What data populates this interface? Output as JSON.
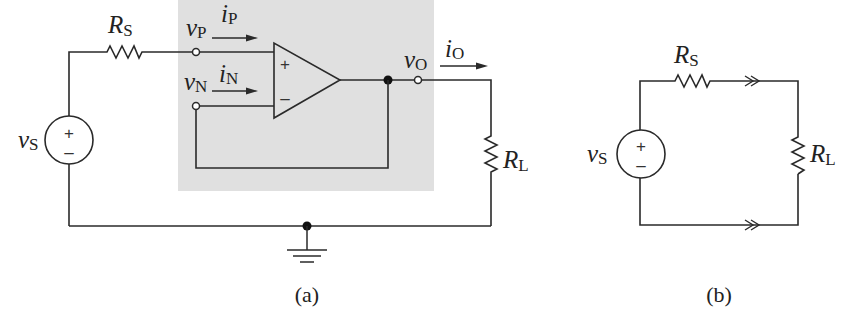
{
  "figure": {
    "a": {
      "caption": "(a)",
      "source": {
        "symbol": "v",
        "subscript": "S",
        "plus": "+",
        "minus": "–"
      },
      "source_resistor": {
        "symbol": "R",
        "subscript": "S"
      },
      "load_resistor": {
        "symbol": "R",
        "subscript": "L"
      },
      "noninverting_input": {
        "voltage_symbol": "v",
        "voltage_subscript": "P",
        "current_symbol": "i",
        "current_subscript": "P"
      },
      "inverting_input": {
        "voltage_symbol": "v",
        "voltage_subscript": "N",
        "current_symbol": "i",
        "current_subscript": "N"
      },
      "output": {
        "voltage_symbol": "v",
        "voltage_subscript": "O",
        "current_symbol": "i",
        "current_subscript": "O"
      },
      "opamp": {
        "plus": "+",
        "minus": "–"
      },
      "shaded_box_color": "#e0e0e0"
    },
    "b": {
      "caption": "(b)",
      "source": {
        "symbol": "v",
        "subscript": "S",
        "plus": "+",
        "minus": "–"
      },
      "source_resistor": {
        "symbol": "R",
        "subscript": "S"
      },
      "load_resistor": {
        "symbol": "R",
        "subscript": "L"
      }
    }
  }
}
